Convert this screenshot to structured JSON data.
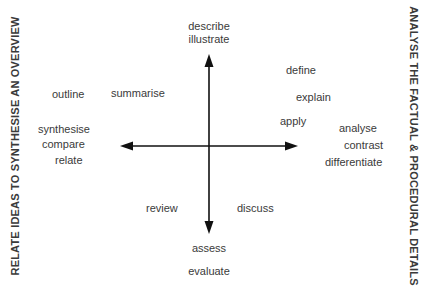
{
  "diagram": {
    "top_label_clipped": "",
    "left_label": "RELATE IDEAS TO SYNTHESISE AN OVERVIEW",
    "right_label": "ANALYSE THE FACTUAL & PROCEDURAL DETAILS",
    "top_words": [
      "describe",
      "illustrate"
    ],
    "bottom_words": [
      "assess",
      "evaluate"
    ],
    "upper_left_words": [
      "outline",
      "summarise"
    ],
    "left_words": [
      "synthesise",
      "compare",
      "relate"
    ],
    "upper_right_words": [
      "define",
      "explain",
      "apply"
    ],
    "right_words": [
      "analyse",
      "contrast",
      "differentiate"
    ],
    "lower_left_words": [
      "review"
    ],
    "lower_right_words": [
      "discuss"
    ],
    "colors": {
      "text": "#3a3a3a",
      "arrow": "#111111",
      "background": "#ffffff"
    }
  }
}
